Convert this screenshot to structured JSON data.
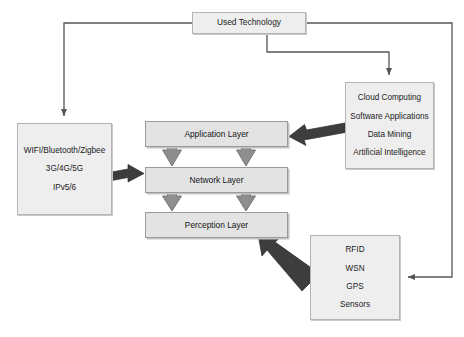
{
  "diagram": {
    "title_box": {
      "label": "Used Technology"
    },
    "connectivity_box": {
      "lines": [
        "WIFI/Bluetooth/Zigbee",
        "3G/4G/5G",
        "IPv5/6"
      ]
    },
    "cloud_box": {
      "lines": [
        "Cloud Computing",
        "Software Applications",
        "Data Mining",
        "Artificial Intelligence"
      ]
    },
    "sensors_box": {
      "lines": [
        "RFID",
        "WSN",
        "GPS",
        "Sensors"
      ]
    },
    "layers": [
      {
        "label": "Application Layer"
      },
      {
        "label": "Network Layer"
      },
      {
        "label": "Perception Layer"
      }
    ],
    "colors": {
      "box_fill": "#eeeeee",
      "layer_fill": "#e3e3e3",
      "box_border": "#b4b4b4",
      "layer_border": "#9a9a9a",
      "thin_connector": "#555555",
      "thick_arrow_fill": "#3d3d3d",
      "block_arrow_fill": "#8e8e8e",
      "block_arrow_border": "#6f6f6f",
      "background": "#ffffff"
    }
  }
}
